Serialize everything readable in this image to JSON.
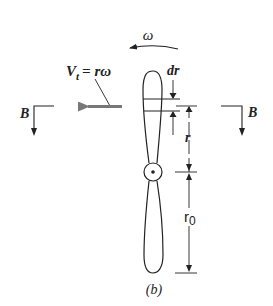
{
  "figure": {
    "caption": "(b)",
    "labels": {
      "omega": "ω",
      "tangential_velocity": "V",
      "tangential_velocity_subscript": "t",
      "tangential_velocity_eq": "= rω",
      "dr": "dr",
      "r": "r",
      "r0": "r",
      "r0_subscript": "0",
      "section_left": "B",
      "section_right": "B"
    },
    "colors": {
      "stroke": "#222222",
      "velocity_arrow": "#777777",
      "background": "#ffffff"
    }
  }
}
